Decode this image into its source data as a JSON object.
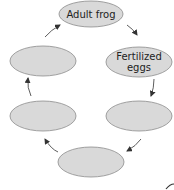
{
  "diagram": {
    "type": "cycle",
    "colors": {
      "fill": "#d9d9d9",
      "stroke": "#8a8a8a",
      "arrow": "#333333",
      "text": "#222222"
    },
    "nodes": [
      {
        "id": "adult-frog",
        "label": "Adult frog"
      },
      {
        "id": "fertilized-eggs",
        "label": "Fertilized\neggs"
      },
      {
        "id": "stage-3",
        "label": ""
      },
      {
        "id": "stage-4",
        "label": ""
      },
      {
        "id": "stage-5",
        "label": ""
      },
      {
        "id": "stage-6",
        "label": ""
      }
    ],
    "edges": [
      [
        "adult-frog",
        "fertilized-eggs"
      ],
      [
        "fertilized-eggs",
        "stage-3"
      ],
      [
        "stage-3",
        "stage-4"
      ],
      [
        "stage-4",
        "stage-5"
      ],
      [
        "stage-5",
        "stage-6"
      ],
      [
        "stage-6",
        "adult-frog"
      ]
    ]
  }
}
